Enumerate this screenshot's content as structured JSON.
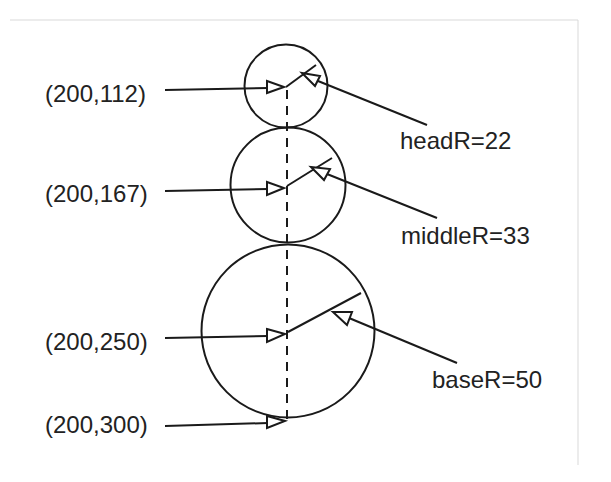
{
  "diagram": {
    "labels": {
      "head_center": "(200,112)",
      "middle_center": "(200,167)",
      "base_center": "(200,250)",
      "base_bottom": "(200,300)",
      "head_radius": "headR=22",
      "middle_radius": "middleR=33",
      "base_radius": "baseR=50"
    },
    "circles": [
      {
        "name": "head",
        "center": "(200,112)",
        "radius_label": "headR=22"
      },
      {
        "name": "middle",
        "center": "(200,167)",
        "radius_label": "middleR=33"
      },
      {
        "name": "base",
        "center": "(200,250)",
        "radius_label": "baseR=50"
      }
    ],
    "colors": {
      "stroke": "#1a1a1a",
      "text": "#222222",
      "frame": "#d9d9d9",
      "background": "#ffffff"
    }
  }
}
